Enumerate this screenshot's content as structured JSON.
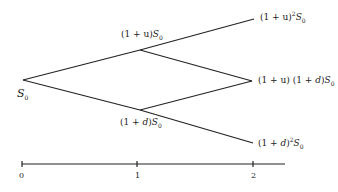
{
  "diagram": {
    "type": "binomial-tree",
    "nodes": {
      "root": {
        "label": "S",
        "sub": "0"
      },
      "up": {
        "prefix": "(1 + u)",
        "var": "S",
        "sub": "0"
      },
      "down": {
        "prefix": "(1 + ",
        "dvar": "d",
        "suffix": ")",
        "var": "S",
        "sub": "0"
      },
      "up_up": {
        "prefix": "(1 + u)",
        "sup": "2",
        "var": "S",
        "sub": "0"
      },
      "up_down": {
        "prefix": "(1 + u) (1 + ",
        "dvar": "d",
        "suffix": ")",
        "var": "S",
        "sub": "0"
      },
      "down_down": {
        "prefix": "(1 + ",
        "dvar": "d",
        "suffix": ")",
        "sup": "2",
        "var": "S",
        "sub": "0"
      }
    },
    "axis": {
      "ticks": [
        "0",
        "1",
        "2"
      ]
    }
  }
}
